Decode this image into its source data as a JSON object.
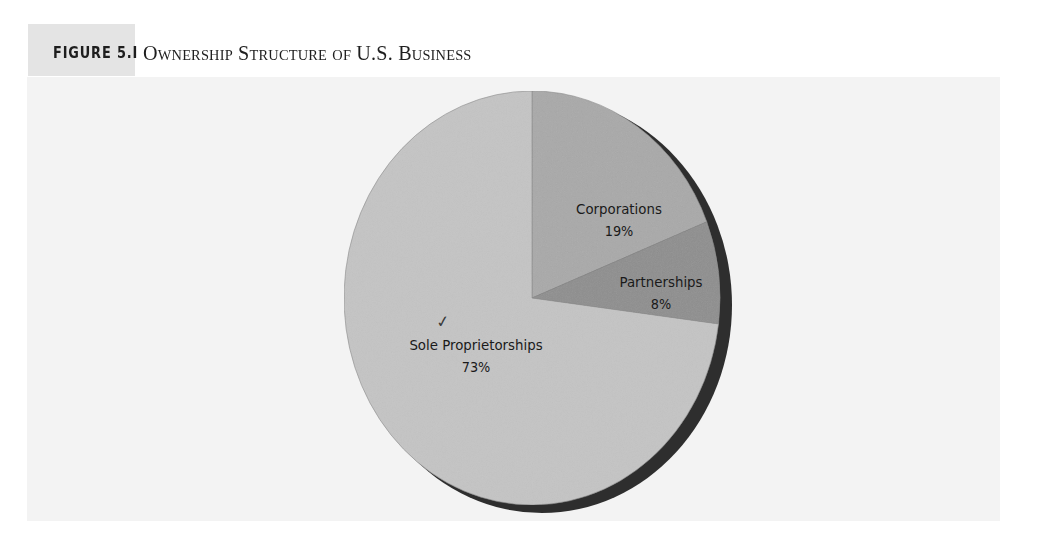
{
  "figure": {
    "label": "FIGURE 5.I",
    "title": "Ownership Structure of U.S. Business"
  },
  "annotation": {
    "check_mark": "✓"
  },
  "colors": {
    "label_box": "#e4e4e4",
    "panel": "#f3f3f3",
    "sole_proprietorships": "#c4c4c4",
    "corporations": "#a9a9a9",
    "partnerships": "#8e8e8e",
    "shadow": "#2e2e2e"
  },
  "chart_data": {
    "type": "pie",
    "title": "Ownership Structure of U.S. Business",
    "figure_number": "Figure 5.1",
    "categories": [
      "Corporations",
      "Partnerships",
      "Sole Proprietorships"
    ],
    "values": [
      19,
      8,
      73
    ],
    "unit": "%",
    "start_angle": "12 o'clock",
    "direction": "clockwise",
    "style": "3D-shadowed pie, grayscale",
    "legend": "none (direct labels on slices)",
    "labels": [
      {
        "name": "Corporations",
        "value": "19%"
      },
      {
        "name": "Partnerships",
        "value": "8%"
      },
      {
        "name": "Sole Proprietorships",
        "value": "73%"
      }
    ]
  }
}
